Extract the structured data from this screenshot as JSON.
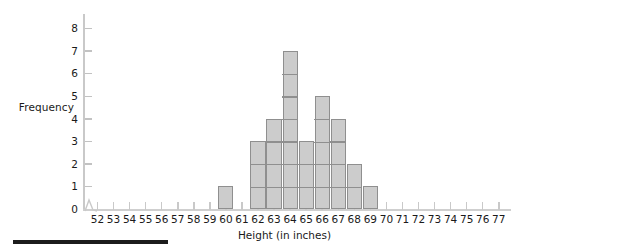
{
  "chart_data": {
    "type": "bar",
    "title": "",
    "subtitle": "",
    "xlabel": "Height (in inches)",
    "ylabel": "Frequency",
    "categories": [
      52,
      53,
      54,
      55,
      56,
      57,
      58,
      59,
      60,
      61,
      62,
      63,
      64,
      65,
      66,
      67,
      68,
      69,
      70,
      71,
      72,
      73,
      74,
      75,
      76,
      77
    ],
    "values": [
      0,
      0,
      0,
      0,
      0,
      0,
      0,
      0,
      1,
      0,
      3,
      4,
      7,
      3,
      5,
      4,
      2,
      1,
      0,
      0,
      0,
      0,
      0,
      0,
      0,
      0
    ],
    "bars": [
      {
        "category": 60,
        "value": 1
      },
      {
        "category": 62,
        "value": 3
      },
      {
        "category": 63,
        "value": 4
      },
      {
        "category": 64,
        "value": 7
      },
      {
        "category": 65,
        "value": 3
      },
      {
        "category": 66,
        "value": 5
      },
      {
        "category": 67,
        "value": 4
      },
      {
        "category": 68,
        "value": 2
      },
      {
        "category": 69,
        "value": 1
      }
    ],
    "xlim": [
      51.5,
      77.5
    ],
    "ylim": [
      0,
      8
    ],
    "x_ticks": [
      "52",
      "53",
      "54",
      "55",
      "56",
      "57",
      "58",
      "59",
      "60",
      "61",
      "62",
      "63",
      "64",
      "65",
      "66",
      "67",
      "68",
      "69",
      "70",
      "71",
      "72",
      "73",
      "74",
      "75",
      "76",
      "77"
    ],
    "y_ticks": [
      "0",
      "1",
      "2",
      "3",
      "4",
      "5",
      "6",
      "7",
      "8"
    ],
    "grid": false,
    "legend": null,
    "axis_break_x": true,
    "bar_fill_color": "#cccccc",
    "bar_edge_color": "#8f8f8f",
    "axis_color": "#c9c9c9",
    "text_color": "#1a1a1a",
    "unit_segments": true
  },
  "footer": {
    "rule_color": "#1c1c1c"
  }
}
